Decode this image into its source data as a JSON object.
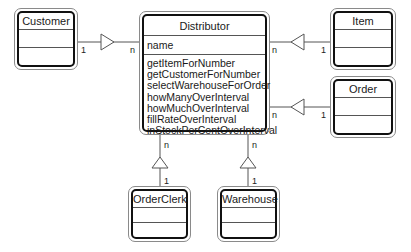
{
  "diagram": {
    "type": "UML class diagram (aggregation)",
    "classes": {
      "distributor": {
        "name": "Distributor",
        "attributes": [
          "name"
        ],
        "operations": [
          "getItemForNumber",
          "getCustomerForNumber",
          "selectWarehouseForOrder",
          "howManyOverInterval",
          "howMuchOverInterval",
          "fillRateOverInterval",
          "inStockPerCentOverInterval"
        ]
      },
      "customer": {
        "name": "Customer"
      },
      "item": {
        "name": "Item"
      },
      "order": {
        "name": "Order"
      },
      "orderclerk": {
        "name": "OrderClerk"
      },
      "warehouse": {
        "name": "Warehouse"
      }
    },
    "associations": [
      {
        "from": "Customer",
        "to": "Distributor",
        "from_mult": "1",
        "to_mult": "n"
      },
      {
        "from": "Item",
        "to": "Distributor",
        "from_mult": "1",
        "to_mult": "n"
      },
      {
        "from": "Order",
        "to": "Distributor",
        "from_mult": "1",
        "to_mult": "n"
      },
      {
        "from": "OrderClerk",
        "to": "Distributor",
        "from_mult": "1",
        "to_mult": "n"
      },
      {
        "from": "Warehouse",
        "to": "Distributor",
        "from_mult": "1",
        "to_mult": "n"
      }
    ],
    "multiplicity": {
      "one": "1",
      "many": "n"
    }
  }
}
